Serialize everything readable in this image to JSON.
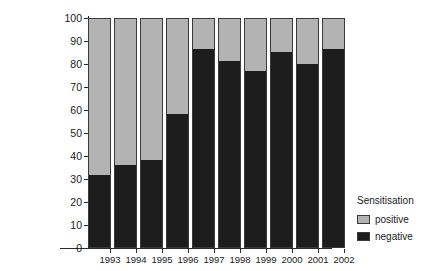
{
  "chart_data": {
    "type": "bar",
    "subtype": "stacked-percentage",
    "title": "",
    "xlabel": "",
    "ylabel": "% transplants",
    "ylim": [
      0,
      100
    ],
    "yticks": [
      0,
      10,
      20,
      30,
      40,
      50,
      60,
      70,
      80,
      90,
      100
    ],
    "ytick_labels": [
      "0",
      "10",
      "20",
      "30",
      "40",
      "50",
      "60",
      "70",
      "80",
      "90",
      "100"
    ],
    "grid": false,
    "legend_position": "right-bottom",
    "legend_title": "Sensitisation",
    "categories": [
      "1993",
      "1994",
      "1995",
      "1996",
      "1997",
      "1998",
      "1999",
      "2000",
      "2001",
      "2002"
    ],
    "series": [
      {
        "name": "negative",
        "color": "#1d1d1d",
        "values": [
          31.5,
          35.5,
          38.0,
          58.0,
          86.0,
          81.0,
          76.5,
          85.0,
          79.5,
          86.0
        ]
      },
      {
        "name": "positive",
        "color": "#b3b3b3",
        "values": [
          68.5,
          64.5,
          62.0,
          42.0,
          14.0,
          19.0,
          23.5,
          15.0,
          20.5,
          14.0
        ]
      }
    ]
  },
  "axes": {
    "y_title": "% transplants"
  },
  "legend": {
    "title": "Sensitisation",
    "items": [
      {
        "label": "positive",
        "color": "#b3b3b3"
      },
      {
        "label": "negative",
        "color": "#1d1d1d"
      }
    ]
  }
}
